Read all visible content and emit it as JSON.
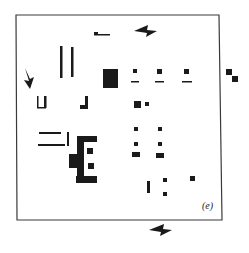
{
  "figure": {
    "panel_label": "(e)",
    "ink_color": "#1a1a1a",
    "frame_color": "#3a3a3a",
    "background": "#ffffff"
  },
  "frame": {
    "points": [
      [
        16,
        15
      ],
      [
        219,
        15
      ],
      [
        222,
        220
      ],
      [
        17,
        220
      ]
    ],
    "stroke_width": 1.2
  },
  "alignment_marks": [
    {
      "name": "alignment-mark-top",
      "points": [
        [
          134,
          31
        ],
        [
          148,
          25
        ],
        [
          147,
          30
        ],
        [
          157,
          31
        ],
        [
          146,
          37
        ],
        [
          147,
          33
        ]
      ]
    },
    {
      "name": "alignment-mark-left",
      "points": [
        [
          25,
          68
        ],
        [
          29,
          81
        ],
        [
          24,
          80
        ],
        [
          30,
          89
        ],
        [
          34,
          77
        ],
        [
          30,
          79
        ]
      ]
    },
    {
      "name": "alignment-mark-bottom",
      "points": [
        [
          149,
          230
        ],
        [
          164,
          224
        ],
        [
          163,
          229
        ],
        [
          172,
          230
        ],
        [
          160,
          236
        ],
        [
          161,
          232
        ]
      ]
    }
  ],
  "rects": [
    {
      "name": "top-small-dash",
      "x": 94,
      "y": 32,
      "w": 4,
      "h": 3
    },
    {
      "name": "top-dash-line",
      "x": 94,
      "y": 34,
      "w": 16,
      "h": 1.5
    },
    {
      "name": "vertical-bar-left",
      "x": 60,
      "y": 46,
      "w": 2.5,
      "h": 32
    },
    {
      "name": "vertical-bar-right",
      "x": 71,
      "y": 47,
      "w": 2.5,
      "h": 30
    },
    {
      "name": "cup-block-base",
      "x": 103,
      "y": 69,
      "w": 15,
      "h": 19
    },
    {
      "name": "cup-block-dot",
      "x": 108,
      "y": 69,
      "w": 3,
      "h": 3
    },
    {
      "name": "pad-1-square",
      "x": 133,
      "y": 69,
      "w": 4,
      "h": 4
    },
    {
      "name": "pad-1-line",
      "x": 131,
      "y": 81,
      "w": 8,
      "h": 1.5
    },
    {
      "name": "pad-2-square",
      "x": 157,
      "y": 69,
      "w": 5,
      "h": 5
    },
    {
      "name": "pad-2-line",
      "x": 155,
      "y": 81,
      "w": 9,
      "h": 1.5
    },
    {
      "name": "pad-3-square",
      "x": 184,
      "y": 69,
      "w": 5,
      "h": 5
    },
    {
      "name": "pad-3-line",
      "x": 182,
      "y": 81,
      "w": 10,
      "h": 1.5
    },
    {
      "name": "side-mark-1",
      "x": 226,
      "y": 69,
      "w": 6,
      "h": 6
    },
    {
      "name": "side-mark-2",
      "x": 232,
      "y": 76,
      "w": 6,
      "h": 6
    },
    {
      "name": "u-shape-left-arm",
      "x": 37,
      "y": 96,
      "w": 1.5,
      "h": 12
    },
    {
      "name": "u-shape-right-arm",
      "x": 44,
      "y": 96,
      "w": 2.5,
      "h": 12
    },
    {
      "name": "u-shape-bottom",
      "x": 37,
      "y": 107,
      "w": 9,
      "h": 1.5
    },
    {
      "name": "l-shape-vertical",
      "x": 85,
      "y": 96,
      "w": 3,
      "h": 12
    },
    {
      "name": "l-shape-foot",
      "x": 80,
      "y": 105,
      "w": 8,
      "h": 4
    },
    {
      "name": "via-large",
      "x": 134,
      "y": 101,
      "w": 7,
      "h": 7
    },
    {
      "name": "via-small",
      "x": 145,
      "y": 102,
      "w": 4,
      "h": 4
    },
    {
      "name": "bracket-top-bar",
      "x": 39,
      "y": 132,
      "w": 22,
      "h": 2
    },
    {
      "name": "bracket-bottom-bar",
      "x": 38,
      "y": 144,
      "w": 27,
      "h": 2
    },
    {
      "name": "bracket-right-tick",
      "x": 67,
      "y": 132,
      "w": 2,
      "h": 14
    },
    {
      "name": "comb-top",
      "x": 77,
      "y": 136,
      "w": 20,
      "h": 6
    },
    {
      "name": "comb-spine",
      "x": 77,
      "y": 136,
      "w": 7,
      "h": 45
    },
    {
      "name": "comb-block-left",
      "x": 69,
      "y": 154,
      "w": 10,
      "h": 14
    },
    {
      "name": "comb-pad-1",
      "x": 87,
      "y": 148,
      "w": 6,
      "h": 6
    },
    {
      "name": "comb-pad-2",
      "x": 88,
      "y": 163,
      "w": 6,
      "h": 6
    },
    {
      "name": "comb-bottom",
      "x": 76,
      "y": 176,
      "w": 21,
      "h": 7
    },
    {
      "name": "grid-pad-r1c1",
      "x": 134,
      "y": 127,
      "w": 4,
      "h": 4
    },
    {
      "name": "grid-pad-r1c2",
      "x": 158,
      "y": 127,
      "w": 4,
      "h": 4
    },
    {
      "name": "grid-pad-r2c1",
      "x": 134,
      "y": 142,
      "w": 4,
      "h": 4
    },
    {
      "name": "grid-pad-r2c2",
      "x": 158,
      "y": 142,
      "w": 4,
      "h": 4
    },
    {
      "name": "grid-pad-r3c1",
      "x": 132,
      "y": 152,
      "w": 8,
      "h": 5
    },
    {
      "name": "grid-pad-r3c2",
      "x": 156,
      "y": 153,
      "w": 8,
      "h": 5
    },
    {
      "name": "lone-vertical-bar",
      "x": 147,
      "y": 181,
      "w": 3,
      "h": 12
    },
    {
      "name": "lone-pad-1",
      "x": 163,
      "y": 178,
      "w": 4,
      "h": 4
    },
    {
      "name": "lone-pad-2",
      "x": 163,
      "y": 192,
      "w": 4,
      "h": 4
    },
    {
      "name": "lone-pad-3",
      "x": 190,
      "y": 176,
      "w": 5,
      "h": 5
    }
  ],
  "label_position": {
    "x": 202,
    "y": 200
  }
}
